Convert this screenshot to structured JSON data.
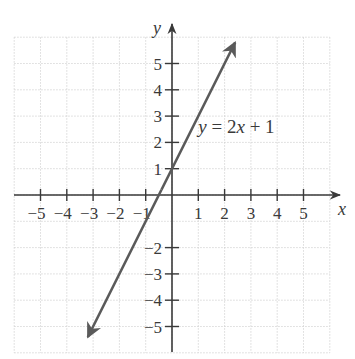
{
  "chart_data": {
    "type": "line",
    "title": "",
    "xlabel": "x",
    "ylabel": "y",
    "xlim": [
      -6,
      6
    ],
    "ylim": [
      -6,
      6
    ],
    "grid": true,
    "x_ticks": [
      -5,
      -4,
      -3,
      -2,
      -1,
      1,
      2,
      3,
      4,
      5
    ],
    "y_ticks": [
      -5,
      -4,
      -3,
      -2,
      1,
      2,
      3,
      4,
      5
    ],
    "x_tick_labels": [
      "−5",
      "−4",
      "−3",
      "−2",
      "−1",
      "1",
      "2",
      "3",
      "4",
      "5"
    ],
    "y_tick_labels": [
      "−5",
      "−4",
      "−3",
      "−2",
      "1",
      "2",
      "3",
      "4",
      "5"
    ],
    "series": [
      {
        "name": "y = 2x + 1",
        "equation": "y = 2x + 1",
        "slope": 2,
        "intercept": 1,
        "x": [
          -3.2,
          2.4
        ],
        "y": [
          -5.4,
          5.8
        ],
        "arrows": "both"
      }
    ],
    "annotations": [
      {
        "text": "y = 2x + 1",
        "x": 1.0,
        "y": 2.6
      }
    ],
    "colors": {
      "line": "#5a5a5a",
      "axis": "#3a3a3a",
      "grid": "#cfcfcf"
    }
  }
}
